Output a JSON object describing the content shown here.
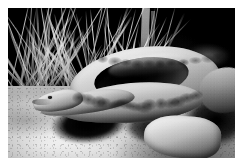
{
  "image": {
    "kind": "photograph",
    "medium": "black-and-white photograph",
    "subject": "coiled rattlesnake",
    "title": "Coiled rattlesnake on sandy ground",
    "alt_text": "Black and white photograph of a rattlesnake coiled on sandy ground in front of dry grass, head raised at left in profile",
    "orientation": "landscape",
    "frame": {
      "border_color": "#ffffff",
      "border_width_px": 8,
      "photo_width_px": 227,
      "photo_height_px": 150
    },
    "palette": {
      "background_dark": "#0d0d0d",
      "brush_shadow": "#17150f",
      "sand_light": "#f2eee3",
      "sand_mid": "#ded8c8",
      "sand_shadow": "#6b6454",
      "snake_highlight": "#efe9da",
      "snake_midtone": "#a79e88",
      "snake_shadow": "#332f26",
      "cast_shadow": "#0a0a09"
    },
    "regions": [
      {
        "name": "background-brush",
        "label": "Dark shaded brush and foliage",
        "position": "upper right and top"
      },
      {
        "name": "dry-grass",
        "label": "Dry grass stalks",
        "position": "upper left"
      },
      {
        "name": "sand-ground",
        "label": "Sunlit sandy ground",
        "position": "lower left and bottom"
      },
      {
        "name": "cast-shadow",
        "label": "Cast shadow of the snake on the sand",
        "position": "center left"
      }
    ],
    "subject_parts": [
      {
        "name": "snake-head",
        "label": "Snake head in profile facing left"
      },
      {
        "name": "snake-eye",
        "label": "Eye"
      },
      {
        "name": "snake-neck",
        "label": "Neck extending from the coil"
      },
      {
        "name": "snake-coil-outer",
        "label": "Outer coil of the body"
      },
      {
        "name": "snake-coil-hollow",
        "label": "Shadowed hollow inside the coil"
      },
      {
        "name": "snake-coil-front",
        "label": "Front loop of the coil with keeled scales"
      },
      {
        "name": "snake-tail-body",
        "label": "Rear body and tail section"
      }
    ]
  }
}
